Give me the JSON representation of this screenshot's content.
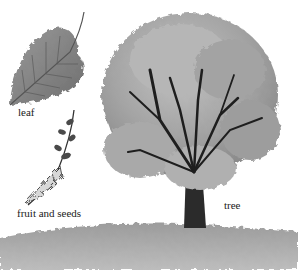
{
  "diagram": {
    "labels": {
      "leaf": "leaf",
      "fruit": "fruit and seeds",
      "tree": "tree"
    },
    "colors": {
      "background": "#ffffff",
      "foliage_light": "#b8b8b8",
      "foliage_mid": "#9a9a9a",
      "foliage_dark": "#7a7a7a",
      "trunk": "#2a2a2a",
      "ground": "#a8a8a8",
      "leaf": "#8c8c8c"
    }
  }
}
